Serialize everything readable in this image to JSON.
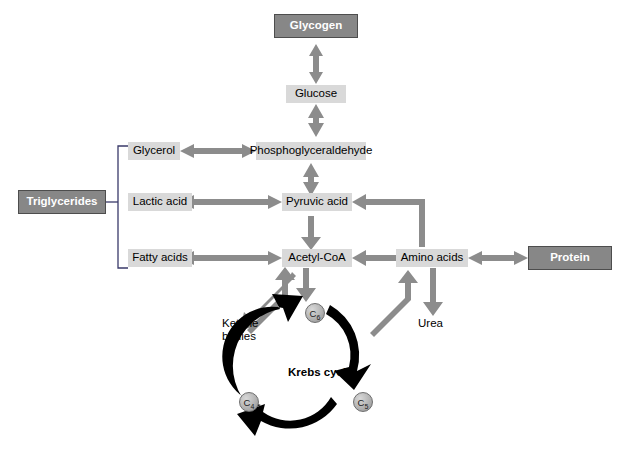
{
  "diagram": {
    "colors": {
      "dark_box_fill": "#878787",
      "dark_box_border": "#4d4d4d",
      "light_box_fill": "#d9d9d9",
      "arrow_gray": "#8c8c8c",
      "cycle_black": "#000000",
      "bracket_line": "#3a3a6a",
      "text_dark": "#000000",
      "text_light": "#ffffff"
    },
    "nodes": [
      {
        "id": "glycogen",
        "label": "Glycogen",
        "style": "dark"
      },
      {
        "id": "glucose",
        "label": "Glucose",
        "style": "light"
      },
      {
        "id": "glycerol",
        "label": "Glycerol",
        "style": "light"
      },
      {
        "id": "phosphoglyceraldehyde",
        "label": "Phosphoglyceraldehyde",
        "style": "light"
      },
      {
        "id": "lactic-acid",
        "label": "Lactic acid",
        "style": "light"
      },
      {
        "id": "pyruvic-acid",
        "label": "Pyruvic acid",
        "style": "light"
      },
      {
        "id": "fatty-acids",
        "label": "Fatty acids",
        "style": "light"
      },
      {
        "id": "acetyl-coa",
        "label": "Acetyl-CoA",
        "style": "light"
      },
      {
        "id": "amino-acids",
        "label": "Amino acids",
        "style": "light"
      },
      {
        "id": "triglycerides",
        "label": "Triglycerides",
        "style": "dark"
      },
      {
        "id": "protein",
        "label": "Protein",
        "style": "dark"
      }
    ],
    "plain_labels": {
      "ketone_bodies_line1": "Ketone",
      "ketone_bodies_line2": "bodies",
      "urea": "Urea"
    },
    "krebs": {
      "label": "Krebs cycle",
      "intermediates": [
        {
          "id": "c6",
          "text": "C",
          "subscript": "6",
          "position": "top"
        },
        {
          "id": "c5",
          "text": "C",
          "subscript": "5",
          "position": "bottom-right"
        },
        {
          "id": "c4",
          "text": "C",
          "subscript": "4",
          "position": "bottom-left"
        }
      ]
    },
    "connections": [
      {
        "from": "glycogen",
        "to": "glucose",
        "type": "bidirectional"
      },
      {
        "from": "glucose",
        "to": "phosphoglyceraldehyde",
        "type": "bidirectional"
      },
      {
        "from": "glycerol",
        "to": "phosphoglyceraldehyde",
        "type": "bidirectional"
      },
      {
        "from": "phosphoglyceraldehyde",
        "to": "pyruvic-acid",
        "type": "bidirectional"
      },
      {
        "from": "lactic-acid",
        "to": "pyruvic-acid",
        "type": "bidirectional"
      },
      {
        "from": "pyruvic-acid",
        "to": "acetyl-coa",
        "type": "unidirectional"
      },
      {
        "from": "fatty-acids",
        "to": "acetyl-coa",
        "type": "bidirectional"
      },
      {
        "from": "amino-acids",
        "to": "acetyl-coa",
        "type": "unidirectional"
      },
      {
        "from": "amino-acids",
        "to": "pyruvic-acid",
        "type": "unidirectional"
      },
      {
        "from": "amino-acids",
        "to": "protein",
        "type": "bidirectional"
      },
      {
        "from": "amino-acids",
        "to": "urea",
        "type": "unidirectional"
      },
      {
        "from": "acetyl-coa",
        "to": "c6",
        "type": "unidirectional"
      },
      {
        "from": "acetyl-coa",
        "to": "ketone-bodies",
        "type": "unidirectional"
      },
      {
        "from": "krebs-cycle",
        "to": "amino-acids",
        "type": "unidirectional"
      },
      {
        "from": "krebs-cycle",
        "to": "acetyl-coa",
        "type": "unidirectional"
      },
      {
        "from": "triglycerides",
        "to": "bracket",
        "type": "line"
      }
    ]
  }
}
